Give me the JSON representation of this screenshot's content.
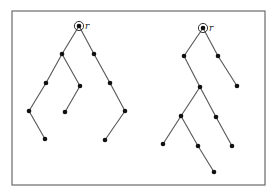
{
  "figure": {
    "frame": {
      "x": 12,
      "y": 11,
      "width": 253,
      "height": 174,
      "color": "#6a6a6a"
    },
    "trees": [
      {
        "name": "left-tree",
        "root_label": "r",
        "nodes": [
          {
            "id": "r",
            "x": 79,
            "y": 26,
            "root": true
          },
          {
            "id": "a",
            "x": 62,
            "y": 54
          },
          {
            "id": "b",
            "x": 94,
            "y": 54
          },
          {
            "id": "c",
            "x": 46,
            "y": 83
          },
          {
            "id": "d",
            "x": 80,
            "y": 86
          },
          {
            "id": "e",
            "x": 110,
            "y": 83
          },
          {
            "id": "f",
            "x": 29,
            "y": 111
          },
          {
            "id": "g",
            "x": 65,
            "y": 112
          },
          {
            "id": "h",
            "x": 125,
            "y": 111
          },
          {
            "id": "i",
            "x": 45,
            "y": 139
          },
          {
            "id": "j",
            "x": 105,
            "y": 140
          }
        ],
        "edges": [
          [
            "r",
            "a"
          ],
          [
            "r",
            "b"
          ],
          [
            "a",
            "c"
          ],
          [
            "a",
            "d"
          ],
          [
            "b",
            "e"
          ],
          [
            "c",
            "f"
          ],
          [
            "d",
            "g"
          ],
          [
            "e",
            "h"
          ],
          [
            "f",
            "i"
          ],
          [
            "h",
            "j"
          ]
        ]
      },
      {
        "name": "right-tree",
        "root_label": "r",
        "nodes": [
          {
            "id": "r",
            "x": 203,
            "y": 28,
            "root": true
          },
          {
            "id": "a",
            "x": 184,
            "y": 56
          },
          {
            "id": "b",
            "x": 218,
            "y": 56
          },
          {
            "id": "c",
            "x": 200,
            "y": 87
          },
          {
            "id": "d",
            "x": 237,
            "y": 86
          },
          {
            "id": "e",
            "x": 181,
            "y": 116
          },
          {
            "id": "f",
            "x": 216,
            "y": 117
          },
          {
            "id": "g",
            "x": 163,
            "y": 144
          },
          {
            "id": "h",
            "x": 198,
            "y": 146
          },
          {
            "id": "i",
            "x": 232,
            "y": 146
          },
          {
            "id": "k",
            "x": 214,
            "y": 172
          }
        ],
        "edges": [
          [
            "r",
            "a"
          ],
          [
            "r",
            "b"
          ],
          [
            "a",
            "c"
          ],
          [
            "b",
            "d"
          ],
          [
            "c",
            "e"
          ],
          [
            "c",
            "f"
          ],
          [
            "e",
            "g"
          ],
          [
            "e",
            "h"
          ],
          [
            "f",
            "i"
          ],
          [
            "h",
            "k"
          ]
        ]
      }
    ],
    "colors": {
      "node": "#111111",
      "edge": "#555555",
      "background": "#ffffff"
    }
  }
}
